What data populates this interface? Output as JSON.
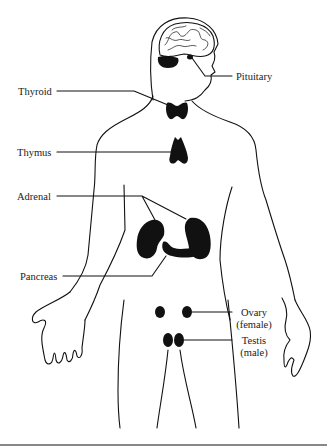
{
  "figure": {
    "labels": {
      "pituitary": "Pituitary",
      "thyroid": "Thyroid",
      "thymus": "Thymus",
      "adrenal": "Adrenal",
      "pancreas": "Pancreas",
      "ovary": "Ovary",
      "ovary_note": "(female)",
      "testis": "Testis",
      "testis_note": "(male)"
    },
    "colors": {
      "ink": "#111111",
      "text": "#222222",
      "rule": "#888888"
    }
  }
}
